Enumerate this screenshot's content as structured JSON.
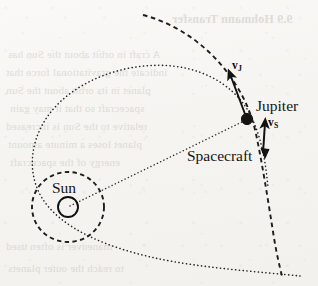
{
  "figure": {
    "name": "gravity-assist-slingshot-diagram",
    "caption_absent": true,
    "background_color": "#f7f6f3",
    "ink_color": "#1a1a1a",
    "width": 318,
    "height": 286
  },
  "labels": {
    "sun": "Sun",
    "jupiter": "Jupiter",
    "spacecraft": "Spacecraft",
    "velocity_jupiter": "v",
    "velocity_jupiter_sub": "J",
    "velocity_spacecraft": "v",
    "velocity_spacecraft_sub": "S"
  },
  "bodies": {
    "sun": {
      "cx": 68,
      "cy": 207,
      "r": 10,
      "style": "open-circle"
    },
    "jupiter": {
      "cx": 247,
      "cy": 119,
      "r": 5.5,
      "style": "filled-dot"
    }
  },
  "paths": {
    "jupiter_orbit_circle": {
      "style": "dashed",
      "cx": 68,
      "cy": 207,
      "rx": 36,
      "ry": 35
    },
    "jupiter_orbit_arc": {
      "style": "dashed",
      "description": "arc of Jupiter orbit passing through Jupiter from upper-left to lower-right"
    },
    "spacecraft_trajectory": {
      "style": "dotted",
      "description": "hyperbolic flyby trajectory looping around the Sun and swinging past Jupiter"
    },
    "sun_jupiter_radius": {
      "style": "dotted",
      "description": "dotted line from Sun to Jupiter"
    }
  },
  "vectors": [
    {
      "name": "v_J",
      "from": [
        245,
        113
      ],
      "to": [
        229,
        72
      ],
      "label": "vJ",
      "meaning": "Jupiter orbital velocity"
    },
    {
      "name": "v_S",
      "from": [
        264,
        152
      ],
      "to": [
        266,
        122
      ],
      "label": "vS",
      "meaning": "Spacecraft velocity"
    }
  ],
  "bleed_through_text": [
    {
      "text": "9.9  Hohmann Transfer",
      "left": 172,
      "top": 12,
      "size": 12
    },
    {
      "text": "A  craft  in  orbit  about  the  Sun  has",
      "left": 8,
      "top": 48,
      "size": 11
    },
    {
      "text": "indicate  the  gravitational  force  that",
      "left": 6,
      "top": 66,
      "size": 11
    },
    {
      "text": "planet  in  its  orbit  about  the  Sun",
      "left": 6,
      "top": 84,
      "size": 11
    },
    {
      "text": "spacecraft  so  that  it  may  gain",
      "left": 10,
      "top": 102,
      "size": 11
    },
    {
      "text": "relative  to  the  Sun  is  increased",
      "left": 6,
      "top": 120,
      "size": 11
    },
    {
      "text": "planet  loses  a  minute  amount",
      "left": 8,
      "top": 138,
      "size": 11
    },
    {
      "text": "energy  of  the  spacecraft",
      "left": 10,
      "top": 156,
      "size": 11
    },
    {
      "text": "maneuver  is  often  used",
      "left": 6,
      "top": 240,
      "size": 11
    },
    {
      "text": "to  reach  the  outer  planets",
      "left": 8,
      "top": 262,
      "size": 11
    }
  ]
}
